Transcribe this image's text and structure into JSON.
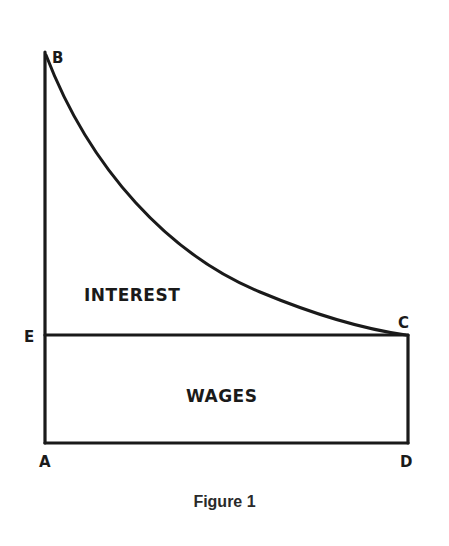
{
  "figure": {
    "caption": "Figure 1",
    "points": {
      "A": "A",
      "B": "B",
      "C": "C",
      "D": "D",
      "E": "E"
    },
    "regions": {
      "upper": "INTEREST",
      "lower": "WAGES"
    },
    "colors": {
      "line": "#1a1a1a",
      "background": "#ffffff"
    }
  }
}
